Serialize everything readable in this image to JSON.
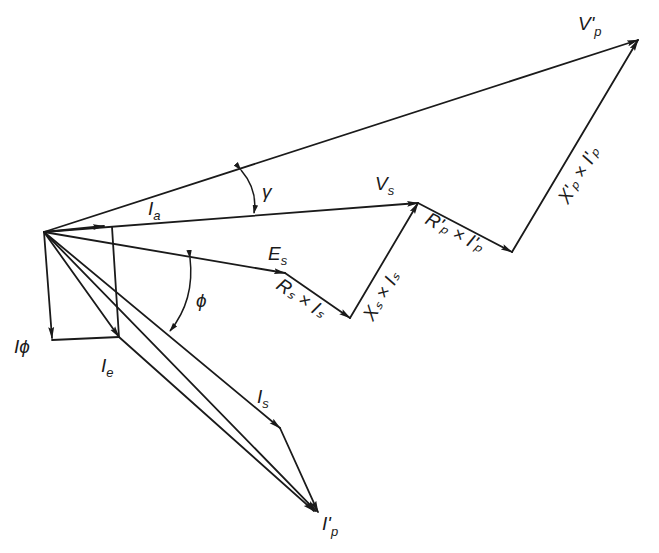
{
  "diagram": {
    "type": "phasor-diagram",
    "stroke_color": "#1a1a1a",
    "background": "#ffffff",
    "labels": {
      "vp_prime": {
        "main": "V'",
        "sub": "p"
      },
      "vs": {
        "main": "V",
        "sub": "s"
      },
      "ia": {
        "main": "I",
        "sub": "a"
      },
      "es": {
        "main": "E",
        "sub": "s"
      },
      "i_phi": "Iϕ",
      "ie": {
        "main": "I",
        "sub": "e"
      },
      "is": {
        "main": "I",
        "sub": "s"
      },
      "ip_prime": {
        "main": "I'",
        "sub": "p"
      },
      "gamma": "γ",
      "phi": "ϕ",
      "rs_is": "Rₛ × Iₛ",
      "xs_is": "Xₛ × Iₛ",
      "rp_ip": "R'ₚ × I'ₚ",
      "xp_ip": "X'ₚ × I'ₚ"
    },
    "points": {
      "origin": [
        44,
        232
      ],
      "ia_end": [
        104,
        226
      ],
      "vs_end": [
        418,
        203
      ],
      "es_end": [
        285,
        273
      ],
      "rs_end": [
        350,
        318
      ],
      "rp_end": [
        512,
        252
      ],
      "vp_end": [
        638,
        40
      ],
      "iphi_end": [
        52,
        338
      ],
      "ie_end": [
        119,
        337
      ],
      "is_end": [
        280,
        428
      ],
      "ip_end": [
        318,
        512
      ]
    }
  }
}
